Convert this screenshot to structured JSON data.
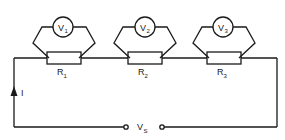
{
  "diagram": {
    "type": "series circuit",
    "resistors": [
      {
        "label": "R",
        "sub": "1"
      },
      {
        "label": "R",
        "sub": "2"
      },
      {
        "label": "R",
        "sub": "3"
      }
    ],
    "voltmeters": [
      {
        "label": "V",
        "sub": "1"
      },
      {
        "label": "V",
        "sub": "2"
      },
      {
        "label": "V",
        "sub": "3"
      }
    ],
    "supply": {
      "label": "V",
      "sub": "S"
    },
    "current": {
      "label": "I"
    },
    "colors": {
      "line": "#1a1a1a",
      "background": "#ffffff"
    }
  }
}
